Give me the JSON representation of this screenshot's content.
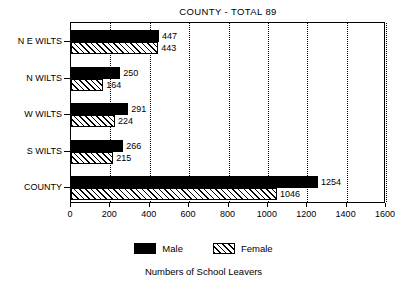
{
  "chart_data": {
    "type": "bar",
    "orientation": "horizontal",
    "title": "COUNTY - TOTAL 89",
    "xlabel": "",
    "ylabel": "",
    "caption": "Numbers of School Leavers",
    "categories": [
      "N E WILTS",
      "N WILTS",
      "W WILTS",
      "S WILTS",
      "COUNTY"
    ],
    "series": [
      {
        "name": "Male",
        "values": [
          447,
          250,
          291,
          266,
          1254
        ]
      },
      {
        "name": "Female",
        "values": [
          443,
          164,
          224,
          215,
          1046
        ]
      }
    ],
    "xlim": [
      0,
      1600
    ],
    "xticks": [
      0,
      200,
      400,
      600,
      800,
      1000,
      1200,
      1400,
      1600
    ],
    "xtick_labels": [
      "0",
      "200",
      "400",
      "600",
      "800",
      "1000",
      "1200",
      "1400",
      "1600"
    ],
    "grid": "vertical-dotted",
    "legend_position": "bottom",
    "legend": [
      {
        "label": "Male",
        "fill": "solid",
        "color": "#000000"
      },
      {
        "label": "Female",
        "fill": "hatched",
        "color": "#000000"
      }
    ],
    "data_labels": {
      "male": [
        "447",
        "250",
        "291",
        "266",
        "1254"
      ],
      "female": [
        "443",
        "164",
        "224",
        "215",
        "1046"
      ]
    }
  }
}
